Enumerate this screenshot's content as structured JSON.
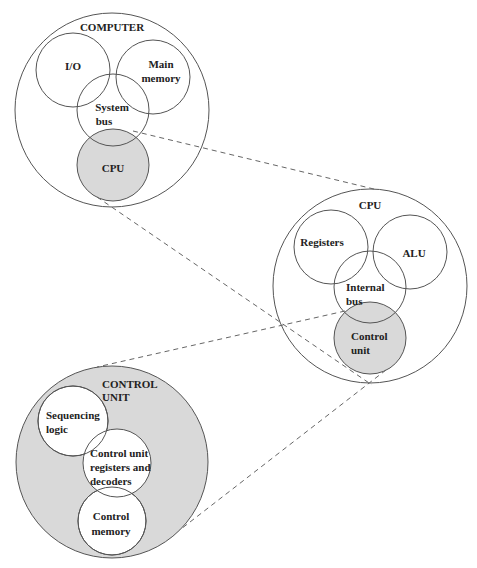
{
  "colors": {
    "stroke": "#555555",
    "shaded": "#d9d9d9",
    "background": "#ffffff",
    "dash": "#666666"
  },
  "computer": {
    "title": "COMPUTER",
    "components": {
      "io": "I/O",
      "main_memory_1": "Main",
      "main_memory_2": "memory",
      "system_bus_1": "System",
      "system_bus_2": "bus",
      "cpu": "CPU"
    }
  },
  "cpu": {
    "title": "CPU",
    "components": {
      "registers": "Registers",
      "alu": "ALU",
      "internal_bus_1": "Internal",
      "internal_bus_2": "bus",
      "control_unit_1": "Control",
      "control_unit_2": "unit"
    }
  },
  "control_unit": {
    "title_1": "CONTROL",
    "title_2": "UNIT",
    "components": {
      "sequencing_logic_1": "Sequencing",
      "sequencing_logic_2": "logic",
      "cu_registers_1": "Control unit",
      "cu_registers_2": "registers and",
      "cu_registers_3": "decoders",
      "control_memory_1": "Control",
      "control_memory_2": "memory"
    }
  }
}
